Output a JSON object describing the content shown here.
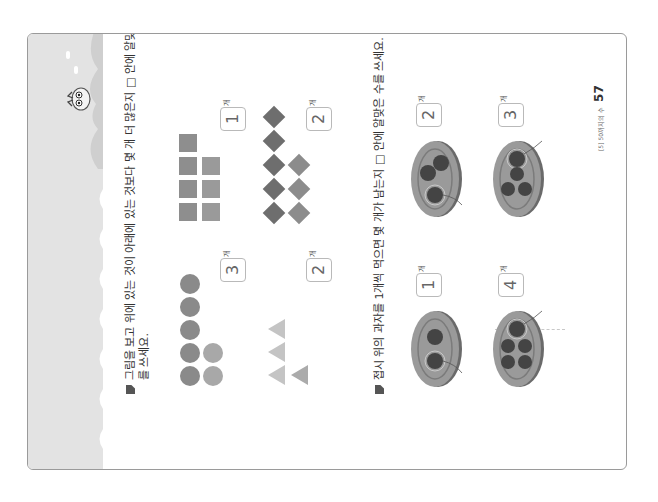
{
  "page": {
    "orientation": "rotated-90-ccw",
    "band_color": "#e3e3e3",
    "mascot": "owl-mascot-icon"
  },
  "problem1": {
    "instruction_line1": "그림을 보고 위에 있는 것이 아래에 있는 것보다 몇 개 더 많은지 □ 안에 알맞은 수",
    "instruction_line2": "를 쓰세요.",
    "items": [
      {
        "id": "circles",
        "shape": "circle",
        "top_count": 5,
        "bottom_count": 2,
        "answer": "3",
        "unit": "개"
      },
      {
        "id": "squares",
        "shape": "square",
        "top_count": 4,
        "bottom_count": 3,
        "answer": "1",
        "unit": "개"
      },
      {
        "id": "triangles",
        "shape": "triangle",
        "top_count": 3,
        "bottom_count": 1,
        "answer": "2",
        "unit": "개"
      },
      {
        "id": "diamonds",
        "shape": "diamond",
        "top_count": 5,
        "bottom_count": 3,
        "answer": "2",
        "unit": "개"
      }
    ]
  },
  "problem2": {
    "instruction": "접시 위의 과자를 1개씩 먹으면 몇 개가 남는지 □ 안에 알맞은 수를 쓰세요.",
    "items": [
      {
        "id": "plate-1",
        "cookies": 2,
        "eaten": 1,
        "answer": "1",
        "unit": "개"
      },
      {
        "id": "plate-2",
        "cookies": 3,
        "eaten": 1,
        "answer": "2",
        "unit": "개"
      },
      {
        "id": "plate-3",
        "cookies": 5,
        "eaten": 1,
        "answer": "4",
        "unit": "개"
      },
      {
        "id": "plate-4",
        "cookies": 4,
        "eaten": 1,
        "answer": "3",
        "unit": "개"
      }
    ]
  },
  "footer": {
    "chapter_label": "[5] 50까지의 수",
    "page_number": "57"
  }
}
